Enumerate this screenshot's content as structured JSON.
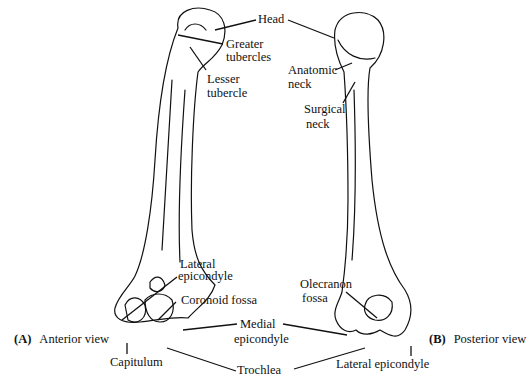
{
  "figure": {
    "views": [
      {
        "letter": "(A)",
        "name": "Anterior view"
      },
      {
        "letter": "(B)",
        "name": "Posterior view"
      }
    ],
    "labels": {
      "head": "Head",
      "greater_tubercles_1": "Greater",
      "greater_tubercles_2": "tubercles",
      "lesser_tubercle_1": "Lesser",
      "lesser_tubercle_2": "tubercle",
      "anatomic_neck_1": "Anatomic",
      "anatomic_neck_2": "neck",
      "surgical_neck_1": "Surgical",
      "surgical_neck_2": "neck",
      "lateral_epicondyle_a_1": "Lateral",
      "lateral_epicondyle_a_2": "epicondyle",
      "coronoid_fossa": "Coronoid fossa",
      "medial_epicondyle_1": "Medial",
      "medial_epicondyle_2": "epicondyle",
      "capitulum": "Capitulum",
      "trochlea": "Trochlea",
      "olecranon_fossa_1": "Olecranon",
      "olecranon_fossa_2": "fossa",
      "lateral_epicondyle_b": "Lateral epicondyle"
    }
  }
}
